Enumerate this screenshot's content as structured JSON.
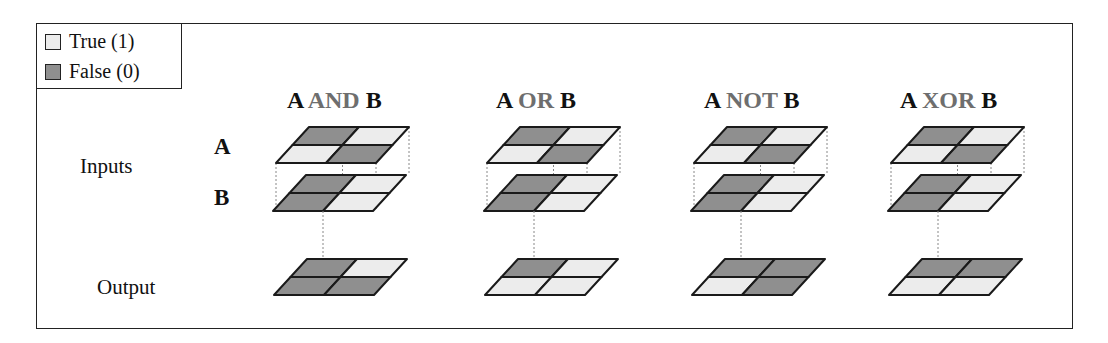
{
  "legend": {
    "true_label": "True (1)",
    "false_label": "False (0)"
  },
  "colors": {
    "true": "#ececec",
    "false": "#8f8f8f",
    "outline": "#1a1a1a",
    "operator_text": "#6e6e6e"
  },
  "row_labels": {
    "inputs": "Inputs",
    "output": "Output",
    "input_a": "A",
    "input_b": "B"
  },
  "operations": [
    {
      "left": "A",
      "op": "AND",
      "right": "B",
      "a": [
        [
          0,
          1
        ],
        [
          1,
          0
        ]
      ],
      "b": [
        [
          0,
          1
        ],
        [
          0,
          1
        ]
      ],
      "out": [
        [
          0,
          1
        ],
        [
          0,
          0
        ]
      ]
    },
    {
      "left": "A",
      "op": "OR",
      "right": "B",
      "a": [
        [
          0,
          1
        ],
        [
          1,
          0
        ]
      ],
      "b": [
        [
          0,
          1
        ],
        [
          0,
          1
        ]
      ],
      "out": [
        [
          0,
          1
        ],
        [
          1,
          1
        ]
      ]
    },
    {
      "left": "A",
      "op": "NOT",
      "right": "B",
      "a": [
        [
          0,
          1
        ],
        [
          1,
          0
        ]
      ],
      "b": [
        [
          0,
          1
        ],
        [
          0,
          1
        ]
      ],
      "out": [
        [
          0,
          0
        ],
        [
          1,
          0
        ]
      ]
    },
    {
      "left": "A",
      "op": "XOR",
      "right": "B",
      "a": [
        [
          0,
          1
        ],
        [
          1,
          0
        ]
      ],
      "b": [
        [
          0,
          1
        ],
        [
          0,
          1
        ]
      ],
      "out": [
        [
          0,
          0
        ],
        [
          1,
          1
        ]
      ]
    }
  ]
}
